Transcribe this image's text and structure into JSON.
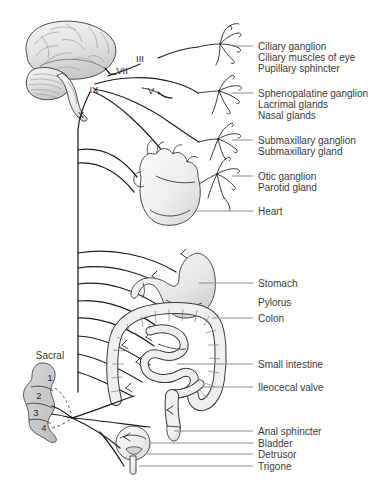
{
  "figure": {
    "kind": "anatomical-diagram",
    "background_color": "#ffffff"
  },
  "colors": {
    "text": "#3b3b3b",
    "leader_line": "#8d8d8d",
    "nerve_line": "#1d1d1d",
    "organ_outline": "#3a3a3a",
    "organ_fill": "#ededed",
    "brain_fill": "#dcdcdc",
    "sacral_fill": "#c8c8c8"
  },
  "cranial_nerves": [
    {
      "id": "nerve-iii",
      "roman": "III"
    },
    {
      "id": "nerve-vii",
      "roman": "VII"
    },
    {
      "id": "nerve-ix",
      "roman": "IX"
    },
    {
      "id": "nerve-v",
      "roman": "V"
    },
    {
      "id": "nerve-x",
      "roman": "X"
    }
  ],
  "spinal_region": {
    "name": "Sacral",
    "segments": [
      "1",
      "2",
      "3",
      "4"
    ]
  },
  "callouts": [
    {
      "id": "ciliary-ganglion",
      "label": "Ciliary ganglion",
      "has_leader": true
    },
    {
      "id": "ciliary-muscles-of-eye",
      "label": "Ciliary muscles of eye",
      "has_leader": false
    },
    {
      "id": "pupillary-sphincter",
      "label": "Pupillary sphincter",
      "has_leader": false
    },
    {
      "id": "sphenopalatine-ganglion",
      "label": "Sphenopalatine ganglion",
      "has_leader": true
    },
    {
      "id": "lacrimal-glands",
      "label": "Lacrimal glands",
      "has_leader": false
    },
    {
      "id": "nasal-glands",
      "label": "Nasal glands",
      "has_leader": false
    },
    {
      "id": "submaxillary-ganglion",
      "label": "Submaxillary ganglion",
      "has_leader": true
    },
    {
      "id": "submaxillary-gland",
      "label": "Submaxillary gland",
      "has_leader": false
    },
    {
      "id": "otic-ganglion",
      "label": "Otic ganglion",
      "has_leader": true
    },
    {
      "id": "parotid-gland",
      "label": "Parotid gland",
      "has_leader": false
    },
    {
      "id": "heart",
      "label": "Heart",
      "has_leader": true
    },
    {
      "id": "stomach",
      "label": "Stomach",
      "has_leader": true
    },
    {
      "id": "pylorus",
      "label": "Pylorus",
      "has_leader": false
    },
    {
      "id": "colon",
      "label": "Colon",
      "has_leader": true
    },
    {
      "id": "small-intestine",
      "label": "Small intestine",
      "has_leader": true
    },
    {
      "id": "ileocecal-valve",
      "label": "Ileocecal valve",
      "has_leader": true
    },
    {
      "id": "anal-sphincter",
      "label": "Anal sphincter",
      "has_leader": true
    },
    {
      "id": "bladder",
      "label": "Bladder",
      "has_leader": true
    },
    {
      "id": "detrusor",
      "label": "Detrusor",
      "has_leader": true
    },
    {
      "id": "trigone",
      "label": "Trigone",
      "has_leader": true
    }
  ],
  "organs": [
    {
      "id": "brain",
      "name": "brain"
    },
    {
      "id": "cerebellum",
      "name": "cerebellum"
    },
    {
      "id": "brainstem",
      "name": "brainstem"
    },
    {
      "id": "heart-organ",
      "name": "heart"
    },
    {
      "id": "stomach-organ",
      "name": "stomach"
    },
    {
      "id": "colon-organ",
      "name": "colon"
    },
    {
      "id": "small-intestine-organ",
      "name": "small intestine"
    },
    {
      "id": "rectum-organ",
      "name": "rectum and anal sphincter"
    },
    {
      "id": "bladder-organ",
      "name": "urinary bladder"
    },
    {
      "id": "sacral-cord",
      "name": "sacral spinal cord segments"
    }
  ]
}
